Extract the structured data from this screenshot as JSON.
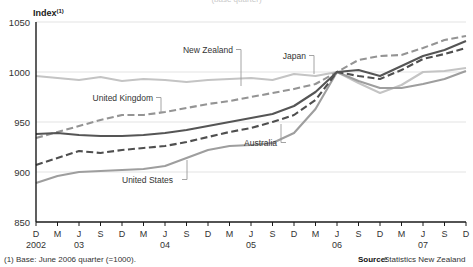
{
  "title_partial": "(base quarter)",
  "axis": {
    "y_label": "Index",
    "y_label_sup": "(1)",
    "y_ticks": [
      850,
      900,
      950,
      1000,
      1050
    ],
    "y_min": 850,
    "y_max": 1050,
    "x_ticks": [
      "D",
      "M",
      "J",
      "S",
      "D",
      "M",
      "J",
      "S",
      "D",
      "M",
      "J",
      "S",
      "D",
      "M",
      "J",
      "S",
      "D",
      "M",
      "J",
      "S",
      "D"
    ],
    "x_years": [
      {
        "index": 0,
        "label": "2002"
      },
      {
        "index": 2,
        "label": "03"
      },
      {
        "index": 6,
        "label": "04"
      },
      {
        "index": 10,
        "label": "05"
      },
      {
        "index": 14,
        "label": "06"
      },
      {
        "index": 18,
        "label": "07"
      }
    ]
  },
  "footnote": "(1) Base: June 2006 quarter (=1000).",
  "source_label": "Source:",
  "source_value": "Statistics New Zealand",
  "annotations": [
    {
      "name": "new-zealand",
      "text": "New Zealand"
    },
    {
      "name": "japan",
      "text": "Japan"
    },
    {
      "name": "united-kingdom",
      "text": "United Kingdom"
    },
    {
      "name": "australia",
      "text": "Australia"
    },
    {
      "name": "united-states",
      "text": "United States"
    }
  ],
  "colors": {
    "new_zealand": "#555555",
    "japan": "#c4c4c4",
    "united_kingdom": "#949494",
    "australia": "#4f4f4f",
    "united_states": "#9e9e9e",
    "grid": "#e3e3e3",
    "axis": "#1a1a1a"
  },
  "chart_data": {
    "type": "line",
    "title": "",
    "xlabel": "",
    "ylabel": "Index",
    "ylim": [
      850,
      1050
    ],
    "grid": true,
    "legend": "annotated-inline",
    "x": [
      "D2002",
      "M03",
      "J03",
      "S03",
      "D03",
      "M04",
      "J04",
      "S04",
      "D04",
      "M05",
      "J05",
      "S05",
      "D05",
      "M06",
      "J06",
      "S06",
      "D06",
      "M07",
      "J07",
      "S07",
      "D07"
    ],
    "series": [
      {
        "name": "New Zealand",
        "style": "solid",
        "color": "#555555",
        "values": [
          938,
          939,
          937,
          936,
          936,
          937,
          939,
          942,
          946,
          950,
          954,
          958,
          966,
          980,
          1000,
          1002,
          996,
          1006,
          1016,
          1022,
          1031
        ]
      },
      {
        "name": "Japan",
        "style": "solid",
        "color": "#c4c4c4",
        "values": [
          996,
          994,
          992,
          995,
          991,
          993,
          992,
          990,
          992,
          993,
          994,
          992,
          998,
          996,
          1000,
          989,
          979,
          987,
          1000,
          1001,
          1004
        ]
      },
      {
        "name": "United Kingdom",
        "style": "dashed",
        "color": "#949494",
        "values": [
          934,
          940,
          946,
          952,
          957,
          957,
          960,
          964,
          968,
          971,
          975,
          979,
          983,
          988,
          1000,
          1012,
          1016,
          1017,
          1024,
          1032,
          1036
        ]
      },
      {
        "name": "Australia",
        "style": "dashed",
        "color": "#4f4f4f",
        "values": [
          907,
          914,
          921,
          919,
          922,
          924,
          926,
          930,
          935,
          940,
          944,
          950,
          957,
          972,
          1000,
          996,
          993,
          1002,
          1013,
          1018,
          1024
        ]
      },
      {
        "name": "United States",
        "style": "solid",
        "color": "#9e9e9e",
        "values": [
          889,
          896,
          900,
          901,
          902,
          903,
          906,
          914,
          922,
          926,
          927,
          929,
          939,
          963,
          1000,
          991,
          984,
          984,
          988,
          993,
          1001
        ]
      }
    ]
  }
}
